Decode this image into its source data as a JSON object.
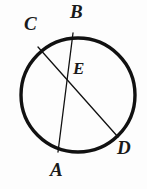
{
  "figure": {
    "background_color": "#fdfdfd",
    "stroke_color": "#111111",
    "label_color": "#1a1a1a",
    "width": 147,
    "height": 189
  },
  "circle": {
    "name": "circle-outline",
    "center_x": 78,
    "center_y": 95,
    "radius": 57,
    "stroke_width": 3.4
  },
  "chords": [
    {
      "name": "chord-AB",
      "from_label": "A",
      "to_label": "B",
      "x1": 58,
      "y1": 152,
      "x2": 73,
      "y2": 33,
      "stroke_width": 1.3
    },
    {
      "name": "chord-CD",
      "from_label": "C",
      "to_label": "D",
      "x1": 38,
      "y1": 47,
      "x2": 118,
      "y2": 137,
      "stroke_width": 1.3
    }
  ],
  "intersection": {
    "name": "point-E",
    "label": "E",
    "x": 65,
    "y": 72
  },
  "labels": {
    "B": "B",
    "C": "C",
    "E": "E",
    "A": "A",
    "D": "D"
  }
}
